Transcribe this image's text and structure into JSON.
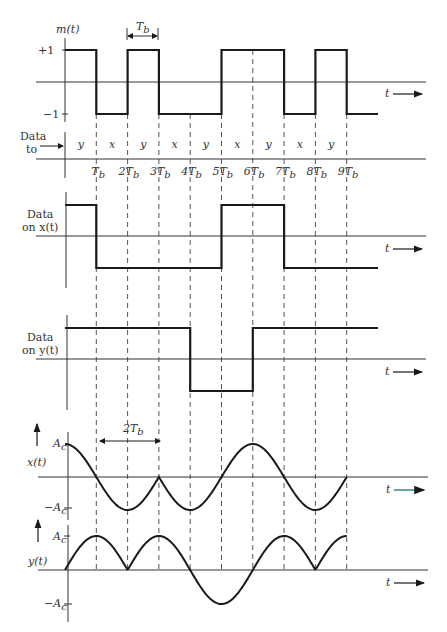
{
  "colors": {
    "line": "#1a1a1a",
    "dash": "#555555",
    "axis": "#333333",
    "accent_arrow": "#2a7f7f"
  },
  "geometry": {
    "t0_x": 65,
    "tb_px": 31.3,
    "n_periods": 9
  },
  "panel_m": {
    "label": "m(t)",
    "ticks": {
      "plus": "+1",
      "minus": "−1"
    },
    "bits": [
      1,
      -1,
      1,
      -1,
      -1,
      1,
      1,
      -1,
      1,
      -1
    ],
    "t_label": "t",
    "period_marker": "T",
    "period_sub": "b"
  },
  "panel_route": {
    "label_line1": "Data",
    "label_line2": "to",
    "slots": [
      "y",
      "x",
      "y",
      "x",
      "y",
      "x",
      "y",
      "x",
      "y"
    ],
    "tick_labels": [
      "T",
      "2T",
      "3T",
      "4T",
      "5T",
      "6T",
      "7T",
      "8T",
      "9T"
    ],
    "tick_sub": "b"
  },
  "panel_xdata": {
    "label_line1": "Data",
    "label_line2": "on x(t)",
    "levels": [
      1,
      -1,
      -1,
      -1,
      -1,
      1,
      1,
      -1,
      -1,
      -1
    ],
    "t_label": "t"
  },
  "panel_ydata": {
    "label_line1": "Data",
    "label_line2": "on y(t)",
    "levels": [
      1,
      1,
      1,
      1,
      -1,
      -1,
      1,
      1,
      1,
      1
    ],
    "t_label": "t"
  },
  "panel_x": {
    "label": "x(t)",
    "ticks": {
      "plus": "A",
      "minus": "−A",
      "sub": "c"
    },
    "span_label": "2T",
    "span_sub": "b",
    "t_label": "t"
  },
  "panel_y": {
    "label": "y(t)",
    "ticks": {
      "plus": "A",
      "minus": "−A",
      "sub": "c"
    },
    "t_label": "t"
  }
}
